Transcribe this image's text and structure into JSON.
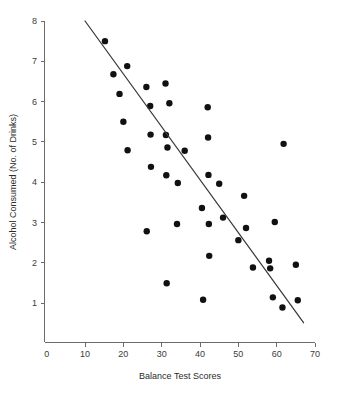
{
  "chart_data": {
    "type": "scatter",
    "title": "",
    "xlabel": "Balance Test Scores",
    "ylabel": "Alcohol Consumed (No. of Drinks)",
    "xlim": [
      0,
      70
    ],
    "ylim": [
      0,
      8
    ],
    "xticks": [
      0,
      10,
      20,
      30,
      40,
      50,
      60,
      70
    ],
    "yticks": [
      1,
      2,
      3,
      4,
      5,
      6,
      7,
      8
    ],
    "xtick_labels": [
      "0",
      "10",
      "20",
      "30",
      "40",
      "50",
      "60",
      "70"
    ],
    "ytick_labels": [
      "1",
      "2",
      "3",
      "4",
      "5",
      "6",
      "7",
      "8"
    ],
    "grid": false,
    "legend": false,
    "legend_position": "none",
    "point_color": "#111111",
    "marker_radius_px": 3.2,
    "axis_color": "#6b6b6b",
    "series": [
      {
        "name": "Participants",
        "marker": "filled-circle",
        "points": [
          [
            15.2,
            7.5
          ],
          [
            17.4,
            6.68
          ],
          [
            19.0,
            6.19
          ],
          [
            20.0,
            5.5
          ],
          [
            21.0,
            6.88
          ],
          [
            21.1,
            4.79
          ],
          [
            26.0,
            6.36
          ],
          [
            26.1,
            2.78
          ],
          [
            27.0,
            5.89
          ],
          [
            27.1,
            5.18
          ],
          [
            27.2,
            4.38
          ],
          [
            31.0,
            6.45
          ],
          [
            31.1,
            5.17
          ],
          [
            31.2,
            4.17
          ],
          [
            31.3,
            1.49
          ],
          [
            31.5,
            4.86
          ],
          [
            32.0,
            5.96
          ],
          [
            34.0,
            2.96
          ],
          [
            34.2,
            3.98
          ],
          [
            36.0,
            4.78
          ],
          [
            40.5,
            3.36
          ],
          [
            40.8,
            1.08
          ],
          [
            42.0,
            5.86
          ],
          [
            42.1,
            5.11
          ],
          [
            42.2,
            4.18
          ],
          [
            42.3,
            2.96
          ],
          [
            42.4,
            2.17
          ],
          [
            45.0,
            3.96
          ],
          [
            46.0,
            3.12
          ],
          [
            50.0,
            2.56
          ],
          [
            51.5,
            3.66
          ],
          [
            52.0,
            2.86
          ],
          [
            53.8,
            1.88
          ],
          [
            58.0,
            2.05
          ],
          [
            58.3,
            1.86
          ],
          [
            59.0,
            1.14
          ],
          [
            59.5,
            3.01
          ],
          [
            61.5,
            0.89
          ],
          [
            61.8,
            4.95
          ],
          [
            65.0,
            1.95
          ],
          [
            65.5,
            1.07
          ]
        ]
      }
    ],
    "trendline": {
      "type": "linear-fit",
      "x_start": 10.0,
      "y_start": 8.0,
      "x_end": 67.0,
      "y_end": 0.51,
      "color": "#3a3a3a"
    }
  },
  "figure": {
    "background_color": "#ffffff"
  }
}
